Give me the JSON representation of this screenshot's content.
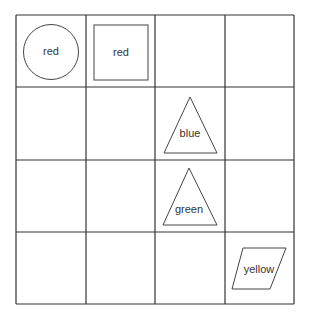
{
  "grid": {
    "rows": 4,
    "cols": 4
  },
  "cells": [
    {
      "row": 0,
      "col": 0,
      "shape": "circle",
      "label": "red"
    },
    {
      "row": 0,
      "col": 1,
      "shape": "square",
      "label": "red"
    },
    {
      "row": 1,
      "col": 2,
      "shape": "triangle",
      "label": "blue"
    },
    {
      "row": 2,
      "col": 2,
      "shape": "triangle",
      "label": "green"
    },
    {
      "row": 3,
      "col": 3,
      "shape": "parallelogram",
      "label": "yellow"
    }
  ],
  "labels": {
    "c0": "red",
    "c1": "red",
    "c2": "blue",
    "c3": "green",
    "c4": "yellow"
  }
}
